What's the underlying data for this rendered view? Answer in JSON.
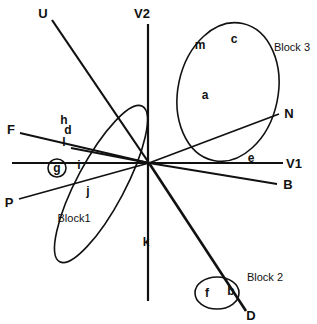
{
  "figure": {
    "type": "biplot",
    "width": 317,
    "height": 324,
    "background": "#ffffff",
    "stroke_color": "#111111",
    "origin": {
      "x": 149,
      "y": 163
    }
  },
  "axes": [
    {
      "name": "V1",
      "label": "V1",
      "from": {
        "x": 12,
        "y": 163
      },
      "to": {
        "x": 283,
        "y": 163
      },
      "label_at": {
        "x": 294,
        "y": 163
      },
      "thickness": 2.2
    },
    {
      "name": "V2",
      "label": "V2",
      "from": {
        "x": 148,
        "y": 24
      },
      "to": {
        "x": 148,
        "y": 301
      },
      "label_at": {
        "x": 142,
        "y": 13
      },
      "thickness": 2.2
    },
    {
      "name": "U",
      "label": "U",
      "from": {
        "x": 52,
        "y": 20
      },
      "to": {
        "x": 149,
        "y": 163
      },
      "label_at": {
        "x": 43,
        "y": 13
      },
      "thickness": 2.2
    },
    {
      "name": "N",
      "label": "N",
      "from": {
        "x": 149,
        "y": 163
      },
      "to": {
        "x": 279,
        "y": 114
      },
      "label_at": {
        "x": 289,
        "y": 113
      },
      "thickness": 1.8
    },
    {
      "name": "B",
      "label": "B",
      "from": {
        "x": 149,
        "y": 163
      },
      "to": {
        "x": 277,
        "y": 184
      },
      "label_at": {
        "x": 288,
        "y": 184
      },
      "thickness": 1.8
    },
    {
      "name": "F",
      "label": "F",
      "from": {
        "x": 20,
        "y": 133
      },
      "to": {
        "x": 149,
        "y": 163
      },
      "label_at": {
        "x": 11,
        "y": 129
      },
      "thickness": 1.8
    },
    {
      "name": "P",
      "label": "P",
      "from": {
        "x": 19,
        "y": 199
      },
      "to": {
        "x": 149,
        "y": 163
      },
      "label_at": {
        "x": 9,
        "y": 202
      },
      "thickness": 1.8
    },
    {
      "name": "D",
      "label": "D",
      "from": {
        "x": 149,
        "y": 163
      },
      "to": {
        "x": 246,
        "y": 311
      },
      "label_at": {
        "x": 251,
        "y": 315
      },
      "thickness": 2.6
    },
    {
      "name": "unlabeled-left-spoke",
      "label": "",
      "from": {
        "x": 71,
        "y": 148
      },
      "to": {
        "x": 149,
        "y": 163
      },
      "label_at": null,
      "thickness": 1.8
    }
  ],
  "ellipses": [
    {
      "name": "block1-ellipse",
      "label": "Block1",
      "cx": 101,
      "cy": 184,
      "rx": 24,
      "ry": 88,
      "rotate": 28,
      "label_at": {
        "x": 74,
        "y": 218
      }
    },
    {
      "name": "block2-ellipse",
      "label": "Block 2",
      "cx": 217,
      "cy": 293,
      "rx": 22,
      "ry": 16,
      "rotate": 0,
      "label_at": {
        "x": 265,
        "y": 277
      }
    },
    {
      "name": "block3-ellipse",
      "label": "Block 3",
      "cx": 228,
      "cy": 92,
      "rx": 50,
      "ry": 70,
      "rotate": 12,
      "label_at": {
        "x": 292,
        "y": 47
      }
    }
  ],
  "points": [
    {
      "name": "point-m",
      "label": "m",
      "x": 200,
      "y": 45
    },
    {
      "name": "point-c",
      "label": "c",
      "x": 234,
      "y": 39
    },
    {
      "name": "point-a",
      "label": "a",
      "x": 205,
      "y": 95
    },
    {
      "name": "point-e",
      "label": "e",
      "x": 251,
      "y": 158
    },
    {
      "name": "point-h",
      "label": "h",
      "x": 64,
      "y": 120
    },
    {
      "name": "point-d",
      "label": "d",
      "x": 68,
      "y": 130
    },
    {
      "name": "point-l",
      "label": "l",
      "x": 64,
      "y": 142
    },
    {
      "name": "point-i",
      "label": "i",
      "x": 79,
      "y": 165
    },
    {
      "name": "point-j",
      "label": "j",
      "x": 88,
      "y": 191
    },
    {
      "name": "point-k",
      "label": "k",
      "x": 146,
      "y": 242
    },
    {
      "name": "point-f",
      "label": "f",
      "x": 207,
      "y": 293
    },
    {
      "name": "point-b",
      "label": "b",
      "x": 231,
      "y": 291
    }
  ],
  "circled_points": [
    {
      "name": "point-g",
      "label": "g",
      "x": 57,
      "y": 168,
      "r": 9
    }
  ]
}
